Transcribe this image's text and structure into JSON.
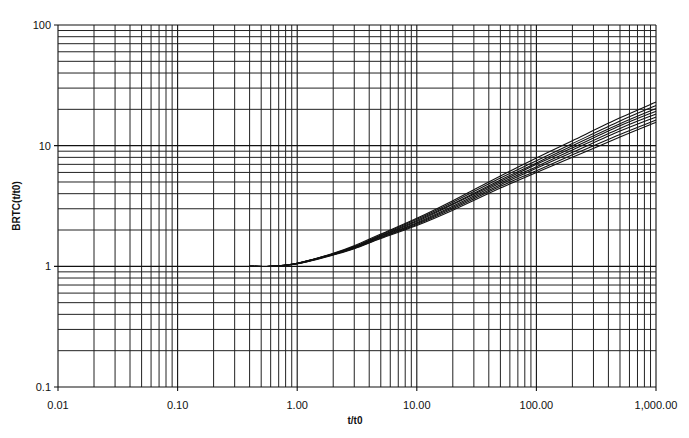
{
  "chart_data": {
    "type": "line",
    "title": "",
    "xlabel": "t/t0",
    "ylabel": "BRTC(t/t0)",
    "xscale": "log",
    "yscale": "log",
    "xlim": [
      0.01,
      1000
    ],
    "ylim": [
      0.1,
      100
    ],
    "grid": true,
    "legend": "none",
    "x_tick_labels": [
      "0.01",
      "0.10",
      "1.00",
      "10.00",
      "100.00",
      "1,000.00"
    ],
    "x_ticks": [
      0.01,
      0.1,
      1,
      10,
      100,
      1000
    ],
    "y_tick_labels": [
      "0.1",
      "1",
      "10",
      "100"
    ],
    "y_ticks": [
      0.1,
      1,
      10,
      100
    ],
    "x": [
      0.4,
      0.6,
      1,
      2,
      3,
      5,
      10,
      20,
      50,
      100,
      200,
      500,
      1000
    ],
    "series": [
      {
        "name": "curve-1",
        "values": [
          1.0,
          1.0,
          1.06,
          1.28,
          1.48,
          1.85,
          2.5,
          3.5,
          5.6,
          7.9,
          11.0,
          17.0,
          23.0
        ]
      },
      {
        "name": "curve-2",
        "values": [
          1.0,
          1.0,
          1.06,
          1.27,
          1.46,
          1.82,
          2.45,
          3.4,
          5.4,
          7.5,
          10.4,
          16.0,
          21.5
        ]
      },
      {
        "name": "curve-3",
        "values": [
          1.0,
          1.0,
          1.06,
          1.27,
          1.45,
          1.8,
          2.4,
          3.3,
          5.2,
          7.2,
          10.0,
          15.2,
          20.3
        ]
      },
      {
        "name": "curve-4",
        "values": [
          1.0,
          1.0,
          1.06,
          1.26,
          1.44,
          1.78,
          2.35,
          3.25,
          5.05,
          7.0,
          9.6,
          14.6,
          19.3
        ]
      },
      {
        "name": "curve-5",
        "values": [
          1.0,
          1.0,
          1.05,
          1.26,
          1.43,
          1.76,
          2.3,
          3.15,
          4.9,
          6.7,
          9.2,
          13.9,
          18.3
        ]
      },
      {
        "name": "curve-6",
        "values": [
          1.0,
          1.0,
          1.05,
          1.25,
          1.42,
          1.74,
          2.26,
          3.08,
          4.75,
          6.5,
          8.8,
          13.2,
          17.3
        ]
      },
      {
        "name": "curve-7",
        "values": [
          1.0,
          1.0,
          1.05,
          1.25,
          1.41,
          1.72,
          2.22,
          3.0,
          4.6,
          6.2,
          8.4,
          12.4,
          16.3
        ]
      },
      {
        "name": "curve-8",
        "values": [
          1.0,
          1.0,
          1.05,
          1.24,
          1.4,
          1.7,
          2.18,
          2.92,
          4.45,
          6.0,
          8.0,
          11.8,
          15.6
        ]
      }
    ]
  }
}
